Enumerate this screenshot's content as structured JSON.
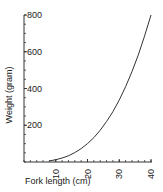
{
  "chart_data": {
    "type": "line",
    "title": "",
    "xlabel": "Fork length (cm)",
    "ylabel": "Weight (gram)",
    "xlim": [
      0,
      40
    ],
    "ylim": [
      0,
      800
    ],
    "x_ticks": [
      10,
      20,
      30,
      40
    ],
    "y_ticks": [
      200,
      400,
      600,
      800
    ],
    "grid": false,
    "legend": null,
    "series": [
      {
        "name": "Weight-length curve",
        "x": [
          8,
          10,
          12,
          14,
          16,
          18,
          20,
          22,
          24,
          26,
          28,
          30,
          32,
          34,
          36,
          38,
          40
        ],
        "values": [
          6,
          12.5,
          22,
          34,
          51,
          73,
          100,
          133,
          173,
          220,
          274,
          338,
          410,
          491,
          583,
          686,
          800
        ]
      }
    ]
  }
}
